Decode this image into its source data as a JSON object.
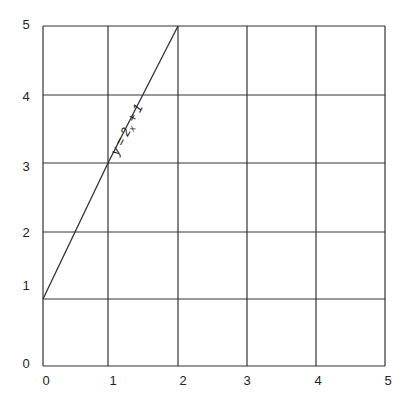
{
  "chart_data": {
    "type": "line",
    "title": "",
    "xlabel": "",
    "ylabel": "",
    "xlim": [
      0,
      5
    ],
    "ylim": [
      0,
      5
    ],
    "grid": true,
    "x_ticks": [
      "0",
      "1",
      "2",
      "3",
      "4",
      "5"
    ],
    "y_ticks": [
      "0",
      "1",
      "2",
      "3",
      "4",
      "5"
    ],
    "series": [
      {
        "name": "y = 2x + 1",
        "label_text": {
          "pre": "y = 2",
          "sub": "x",
          "post": " + 1"
        },
        "x": [
          0,
          1,
          2
        ],
        "y": [
          1,
          3,
          5
        ],
        "color": "#333333"
      }
    ],
    "annotations": [
      {
        "text": "y = 2x + 1",
        "position": "along line, near x=1.2, y=3.6",
        "rotation_deg": -63
      }
    ]
  },
  "colors": {
    "grid": "#333333",
    "background": "#ffffff"
  }
}
